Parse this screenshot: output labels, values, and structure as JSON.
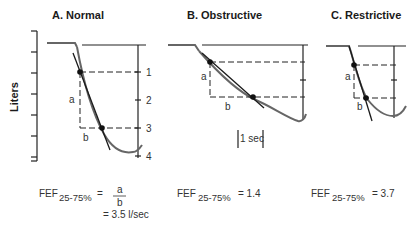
{
  "figure": {
    "y_axis_label": "Liters",
    "time_scale_label": "1 sec",
    "panels": [
      {
        "id": "A",
        "title": "A. Normal",
        "right_axis_ticks": [
          "1",
          "2",
          "3",
          "4"
        ],
        "segment_labels": {
          "a": "a",
          "b": "b"
        },
        "equation": {
          "lhs": "FEF",
          "subscript": "25-75%",
          "eq_sign": "=",
          "numerator": "a",
          "denominator": "b",
          "result": "= 3.5 l/sec"
        }
      },
      {
        "id": "B",
        "title": "B. Obstructive",
        "segment_labels": {
          "a": "a",
          "b": "b"
        },
        "equation": {
          "lhs": "FEF",
          "subscript": "25-75%",
          "rhs": "= 1.4"
        }
      },
      {
        "id": "C",
        "title": "C. Restrictive",
        "segment_labels": {
          "a": "a",
          "b": "b"
        },
        "equation": {
          "lhs": "FEF",
          "subscript": "25-75%",
          "rhs": "= 3.7"
        }
      }
    ]
  }
}
